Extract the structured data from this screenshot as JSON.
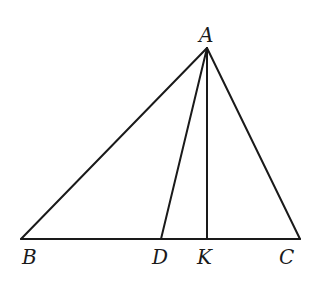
{
  "diagram": {
    "type": "triangle",
    "points": {
      "A": {
        "label": "A",
        "x": 207,
        "y": 48
      },
      "B": {
        "label": "B",
        "x": 21,
        "y": 239
      },
      "C": {
        "label": "C",
        "x": 300,
        "y": 239
      },
      "D": {
        "label": "D",
        "x": 161,
        "y": 239
      },
      "K": {
        "label": "K",
        "x": 207,
        "y": 239
      }
    },
    "segments": [
      "AB",
      "AC",
      "BC",
      "AD",
      "AK"
    ]
  }
}
